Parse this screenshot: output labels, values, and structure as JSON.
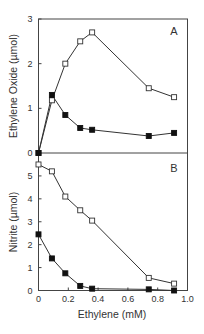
{
  "chart_data": [
    {
      "type": "line",
      "panel": "A",
      "title": "",
      "panel_label": "A",
      "xlabel": "",
      "ylabel": "Ethylene Oxide (µmol)",
      "xlim": [
        0,
        1.0
      ],
      "ylim": [
        0,
        3
      ],
      "yticks": [
        0,
        1,
        2,
        3
      ],
      "grid": false,
      "legend": null,
      "series": [
        {
          "name": "open squares",
          "marker": "open-square",
          "x": [
            0,
            0.09,
            0.18,
            0.28,
            0.36,
            0.74,
            0.91
          ],
          "y": [
            0,
            1.18,
            2.0,
            2.5,
            2.7,
            1.45,
            1.25
          ]
        },
        {
          "name": "filled squares",
          "marker": "filled-square",
          "x": [
            0,
            0.09,
            0.18,
            0.28,
            0.36,
            0.74,
            0.91
          ],
          "y": [
            0,
            1.3,
            0.85,
            0.56,
            0.52,
            0.38,
            0.45
          ]
        }
      ]
    },
    {
      "type": "line",
      "panel": "B",
      "title": "",
      "panel_label": "B",
      "xlabel": "Ethylene (mM)",
      "ylabel": "Nitrite (µmol)",
      "xlim": [
        0,
        1.0
      ],
      "ylim": [
        0,
        6
      ],
      "xticks": [
        0,
        0.2,
        0.4,
        0.6,
        0.8,
        1.0
      ],
      "yticks": [
        0,
        1,
        2,
        3,
        4,
        5
      ],
      "grid": false,
      "legend": null,
      "series": [
        {
          "name": "open squares",
          "marker": "open-square",
          "x": [
            0,
            0.09,
            0.18,
            0.28,
            0.36,
            0.74,
            0.91
          ],
          "y": [
            5.5,
            5.2,
            4.1,
            3.5,
            3.05,
            0.55,
            0.3
          ]
        },
        {
          "name": "filled squares",
          "marker": "filled-square",
          "x": [
            0,
            0.09,
            0.18,
            0.28,
            0.36,
            0.74,
            0.91
          ],
          "y": [
            2.45,
            1.4,
            0.75,
            0.2,
            0.08,
            0.05,
            0.0
          ]
        }
      ]
    }
  ],
  "labels": {
    "panel_a": "A",
    "panel_b": "B",
    "y_label_a": "Ethylene Oxide (µmol)",
    "y_label_b": "Nitrite (µmol)",
    "x_label": "Ethylene (mM)",
    "x_ticks": [
      "0",
      "0.2",
      "0.4",
      "0.6",
      "0.8",
      "1.0"
    ],
    "y_ticks_a": [
      "0",
      "1",
      "2",
      "3"
    ],
    "y_ticks_b": [
      "0",
      "1",
      "2",
      "3",
      "4",
      "5"
    ]
  },
  "colors": {
    "line": "#333333",
    "frame": "#444444",
    "filled_marker": "#111111",
    "open_marker_fill": "#ffffff"
  }
}
